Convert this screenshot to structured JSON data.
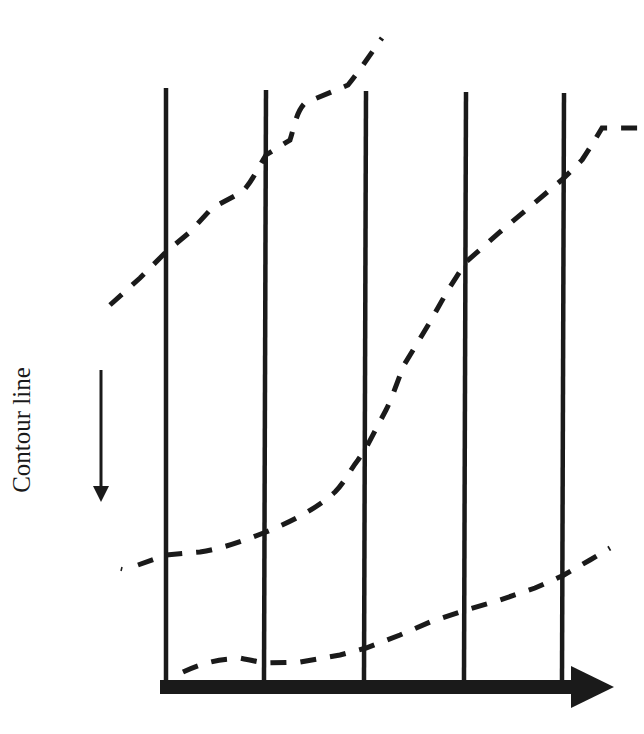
{
  "diagram": {
    "label": "Contour line",
    "colors": {
      "ink": "#1a1a1a",
      "background": "#ffffff"
    },
    "vertical_lines": {
      "count": 5,
      "x_positions": [
        166,
        266,
        366,
        466,
        564
      ],
      "top": 88,
      "bottom": 680
    },
    "direction_arrow": {
      "orientation": "down",
      "x": 101,
      "y_start": 370,
      "y_end": 500
    },
    "horizontal_axis_arrow": {
      "orientation": "right",
      "y": 687,
      "x_start": 160,
      "x_end": 614
    },
    "contour_lines": [
      {
        "name": "upper-contour",
        "style": "dashed"
      },
      {
        "name": "middle-contour",
        "style": "dashed"
      },
      {
        "name": "lower-contour",
        "style": "dashed"
      }
    ]
  }
}
